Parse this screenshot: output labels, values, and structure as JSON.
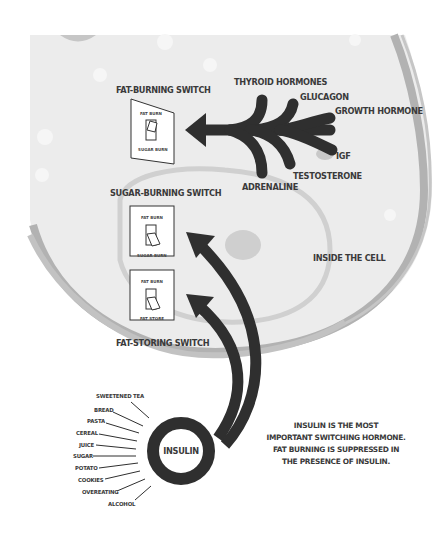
{
  "cell_label": "INSIDE THE CELL",
  "switches": [
    {
      "name": "FAT-BURNING SWITCH",
      "top_label": "FAT BURN",
      "bottom_label": "SUGAR BURN",
      "position": "up"
    },
    {
      "name": "SUGAR-BURNING SWITCH",
      "top_label": "FAT BURN",
      "bottom_label": "SUGAR BURN",
      "position": "down"
    },
    {
      "name": "FAT-STORING SWITCH",
      "top_label": "FAT BURN",
      "bottom_label": "FAT STORE",
      "position": "down"
    }
  ],
  "fat_burning_hormones": [
    "THYROID HORMONES",
    "GLUCAGON",
    "GROWTH HORMONE",
    "IGF",
    "TESTOSTERONE",
    "ADRENALINE"
  ],
  "insulin": {
    "label": "INSULIN",
    "triggers": [
      "SWEETENED TEA",
      "BREAD",
      "PASTA",
      "CEREAL",
      "JUICE",
      "SUGAR",
      "POTATO",
      "COOKIES",
      "OVEREATING",
      "ALCOHOL"
    ]
  },
  "note": [
    "INSULIN IS THE MOST",
    "IMPORTANT SWITCHING HORMONE.",
    "FAT BURNING IS SUPPRESSED IN",
    "THE PRESENCE OF INSULIN."
  ],
  "colors": {
    "arrow": "#2f2f2f",
    "cell_fill": "#ececec",
    "membrane": "#b4b4b4",
    "inner_membrane": "#cfcfcf"
  }
}
